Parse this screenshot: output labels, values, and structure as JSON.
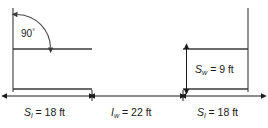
{
  "diagram": {
    "angle": {
      "value": "90",
      "degree_symbol": "°",
      "name": "right-angle-annotation"
    },
    "dimensions": [
      {
        "id": "left-span",
        "symbol": "S",
        "subscript": "l",
        "equals": " = ",
        "value": "18",
        "unit": " ft",
        "orientation": "horizontal",
        "full_text": "S_l = 18 ft"
      },
      {
        "id": "gap-width",
        "symbol": "I",
        "subscript": "w",
        "equals": " = ",
        "value": "22",
        "unit": " ft",
        "orientation": "horizontal",
        "full_text": "I_w = 22 ft"
      },
      {
        "id": "right-span",
        "symbol": "S",
        "subscript": "l",
        "equals": " = ",
        "value": "18",
        "unit": " ft",
        "orientation": "horizontal",
        "full_text": "S_l = 18 ft"
      },
      {
        "id": "wall-height",
        "symbol": "S",
        "subscript": "w",
        "equals": " = ",
        "value": "9",
        "unit": " ft",
        "orientation": "vertical",
        "full_text": "S_w = 9 ft"
      }
    ],
    "colors": {
      "background": "#ffffff",
      "structure_stroke": "#3a3a3a",
      "wall_stroke": "#6e6e6e",
      "dimension_stroke": "#1a1a1a",
      "arc_stroke": "#4a4a4a",
      "text": "#1a1a1a"
    }
  }
}
